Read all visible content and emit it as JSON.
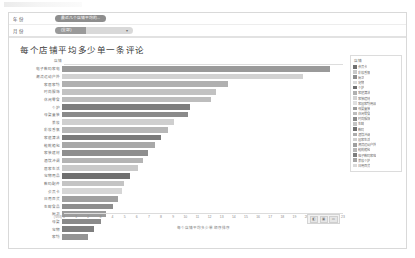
{
  "window": {
    "top_strip_hint": ""
  },
  "filters": {
    "rows": [
      {
        "label": "年 份",
        "control_type": "pill",
        "value": "最近几个店铺平均的..."
      },
      {
        "label": "月 份",
        "control_type": "select",
        "value": "(全部)",
        "caret": "▾"
      }
    ]
  },
  "legend": {
    "title": "店铺",
    "items": [
      {
        "label": "会员卡",
        "color": "#707070"
      },
      {
        "label": "彩妆香氛",
        "color": "#c9c9c9"
      },
      {
        "label": "厨卫",
        "color": "#8e8e8e"
      },
      {
        "label": "宠物",
        "color": "#dcdcdc"
      },
      {
        "label": "个护",
        "color": "#6f6f6f"
      },
      {
        "label": "家庭清洁",
        "color": "#b0b0b0"
      },
      {
        "label": "家装建材",
        "color": "#d2d2d2"
      },
      {
        "label": "家居家纺用品",
        "color": "#e0e0e0"
      },
      {
        "label": "母婴童装",
        "color": "#9a9a9a"
      },
      {
        "label": "休闲零食",
        "color": "#bdbdbd"
      },
      {
        "label": "时尚服饰",
        "color": "#8a8a8a"
      },
      {
        "label": "生鲜",
        "color": "#c4c4c4"
      },
      {
        "label": "数码",
        "color": "#707070"
      },
      {
        "label": "酒饮冲调",
        "color": "#adadad"
      },
      {
        "label": "居家生活",
        "color": "#cfcfcf"
      },
      {
        "label": "潮流运动户外",
        "color": "#9f9f9f"
      },
      {
        "label": "鞋靴箱包",
        "color": "#b7b7b7"
      },
      {
        "label": "电子数码家电",
        "color": "#7d7d7d"
      },
      {
        "label": "美妆个护",
        "color": "#a5a5a5"
      },
      {
        "label": "日用百货",
        "color": "#dadada"
      }
    ]
  },
  "chart_data": {
    "type": "bar",
    "orientation": "horizontal",
    "title": "每个店铺平均多少单一条评论",
    "xlabel": "每个店铺平均多少单 顺序排序",
    "ylabel": "店铺",
    "ylabel_header": "店铺",
    "zero_label": "(空白)",
    "xlim": [
      0,
      23
    ],
    "xticks": [
      0,
      1,
      2,
      3,
      4,
      5,
      6,
      7,
      8,
      9,
      10,
      11,
      12,
      13,
      14,
      15,
      16,
      17,
      18,
      19,
      20,
      21,
      22,
      23
    ],
    "grid": false,
    "legend_position": "right",
    "categories": [
      "电子数码家电",
      "潮流运动户外",
      "家居家纺",
      "时尚服饰",
      "休闲零食",
      "个护",
      "母婴童装",
      "美妆",
      "彩妆香氛",
      "家庭清洁",
      "鞋靴箱包",
      "家装建材",
      "酒饮冲调",
      "居家生活",
      "宠物用品",
      "数码配件",
      "会员卡",
      "日用百货",
      "生鲜食品",
      "厨卫",
      "母婴",
      "宠物",
      "家纺"
    ],
    "values": [
      21.9,
      19.7,
      13.6,
      12.6,
      12.2,
      10.5,
      10.3,
      9.2,
      8.7,
      8.1,
      7.6,
      7.0,
      6.6,
      6.2,
      5.6,
      5.1,
      4.9,
      4.6,
      4.2,
      3.6,
      3.2,
      2.6,
      2.1
    ],
    "bar_colors": [
      "#9a9a9a",
      "#d2d2d2",
      "#b0b0b0",
      "#c2c2c2",
      "#bdbdbd",
      "#7d7d7d",
      "#8a8a8a",
      "#cfcfcf",
      "#b7b7b7",
      "#7a7a7a",
      "#a8a8a8",
      "#8e8e8e",
      "#b4b4b4",
      "#c9c9c9",
      "#6f6f6f",
      "#c4c4c4",
      "#d6d6d6",
      "#a0a0a0",
      "#8e8e8e",
      "#9c9c9c",
      "#8a8a8a",
      "#7f7f7f",
      "#949494"
    ]
  },
  "mini_toolbar": {
    "buttons": [
      "◧",
      "▣",
      "▭"
    ]
  }
}
